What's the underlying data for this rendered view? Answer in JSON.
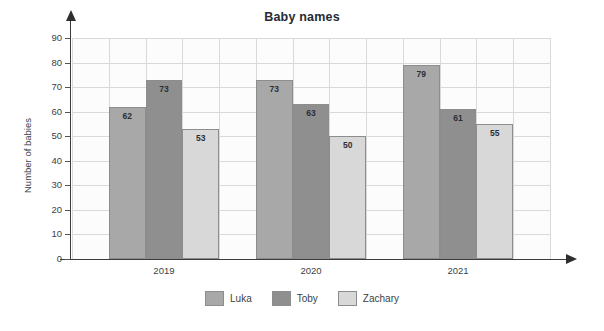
{
  "chart_data": {
    "type": "bar",
    "title": "Baby names",
    "xlabel": "",
    "ylabel": "Number of babies",
    "categories": [
      "2019",
      "2020",
      "2021"
    ],
    "series": [
      {
        "name": "Luka",
        "color": "#a8a8a8",
        "values": [
          62,
          73,
          79
        ]
      },
      {
        "name": "Toby",
        "color": "#8f8f8f",
        "values": [
          73,
          63,
          61
        ]
      },
      {
        "name": "Zachary",
        "color": "#d8d8d8",
        "values": [
          53,
          50,
          55
        ]
      }
    ],
    "ylim": [
      0,
      90
    ],
    "ytick_step": 10,
    "yticks": [
      "90",
      "80",
      "70",
      "60",
      "50",
      "40",
      "30",
      "20",
      "10",
      "0"
    ],
    "grid": true,
    "legend_position": "bottom",
    "show_value_labels": true,
    "axis_arrows": true,
    "grid_color": "#d9d9d9",
    "plot_background": "#fcfcfc",
    "axis_color": "#3c3c3c",
    "bar_border_color": "#8d8d8d",
    "title_color": "#262b33"
  },
  "icons": {
    "y_axis_arrow": "arrow-up-icon",
    "x_axis_arrow": "arrow-right-icon"
  }
}
